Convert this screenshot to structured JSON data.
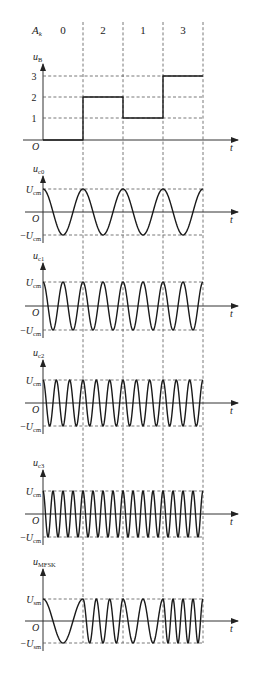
{
  "figure": {
    "title_symbol": "A",
    "title_sub": "k",
    "symbols": [
      "0",
      "2",
      "1",
      "3"
    ],
    "time_label": "t",
    "origin_label": "O"
  },
  "layout": {
    "axis_x": 43,
    "segment_edges": [
      43,
      83,
      123,
      163,
      203
    ],
    "axis_end_x": 238,
    "dash_top": 22,
    "dash_bottom": 643
  },
  "panels": [
    {
      "id": "uB",
      "label_main": "u",
      "label_sub": "B",
      "type": "step",
      "zero_y": 140,
      "levels": [
        {
          "value": "1",
          "y": 118
        },
        {
          "value": "2",
          "y": 97
        },
        {
          "value": "3",
          "y": 76
        }
      ],
      "step_values": [
        0,
        2,
        1,
        3
      ],
      "label_y": 60
    },
    {
      "id": "uc0",
      "label_main": "u",
      "label_sub": "c0",
      "type": "carrier",
      "zero_y": 212,
      "amp_px": 23,
      "amp_label": "U",
      "amp_sub": "cm",
      "cycles_per_segment": [
        1,
        1,
        1,
        1
      ],
      "label_y": 172
    },
    {
      "id": "uc1",
      "label_main": "u",
      "label_sub": "c1",
      "type": "carrier",
      "zero_y": 306,
      "amp_px": 24,
      "amp_label": "U",
      "amp_sub": "cm",
      "cycles_per_segment": [
        2,
        2,
        2,
        2
      ],
      "label_y": 259
    },
    {
      "id": "uc2",
      "label_main": "u",
      "label_sub": "c2",
      "type": "carrier",
      "zero_y": 403,
      "amp_px": 23,
      "amp_label": "U",
      "amp_sub": "cm",
      "cycles_per_segment": [
        3,
        3,
        3,
        3
      ],
      "label_y": 356
    },
    {
      "id": "uc3",
      "label_main": "u",
      "label_sub": "c3",
      "type": "carrier",
      "zero_y": 514,
      "amp_px": 23,
      "amp_label": "U",
      "amp_sub": "cm",
      "cycles_per_segment": [
        4,
        4,
        4,
        4
      ],
      "label_y": 466
    },
    {
      "id": "uMFSK",
      "label_main": "u",
      "label_sub": "MFSK",
      "type": "carrier",
      "zero_y": 621,
      "amp_px": 22,
      "amp_label": "U",
      "amp_sub": "sm",
      "cycles_per_segment": [
        1,
        3,
        2,
        4
      ],
      "label_y": 565
    }
  ],
  "chart_data": {
    "type": "line",
    "symbol_sequence": [
      0,
      2,
      1,
      3
    ],
    "series": [
      {
        "name": "u_B (baseband level)",
        "values": [
          0,
          2,
          1,
          3
        ]
      },
      {
        "name": "u_c0 carrier cycles per symbol",
        "values": [
          1,
          1,
          1,
          1
        ]
      },
      {
        "name": "u_c1 carrier cycles per symbol",
        "values": [
          2,
          2,
          2,
          2
        ]
      },
      {
        "name": "u_c2 carrier cycles per symbol",
        "values": [
          3,
          3,
          3,
          3
        ]
      },
      {
        "name": "u_c3 carrier cycles per symbol",
        "values": [
          4,
          4,
          4,
          4
        ]
      },
      {
        "name": "u_MFSK cycles per symbol",
        "values": [
          1,
          3,
          2,
          4
        ]
      }
    ],
    "xlabel": "t",
    "ylabels": [
      "u_B",
      "u_c0",
      "u_c1",
      "u_c2",
      "u_c3",
      "u_MFSK"
    ],
    "amplitude_labels": [
      "U_cm",
      "-U_cm",
      "U_sm",
      "-U_sm"
    ],
    "ytick_labels_uB": [
      "1",
      "2",
      "3"
    ]
  }
}
